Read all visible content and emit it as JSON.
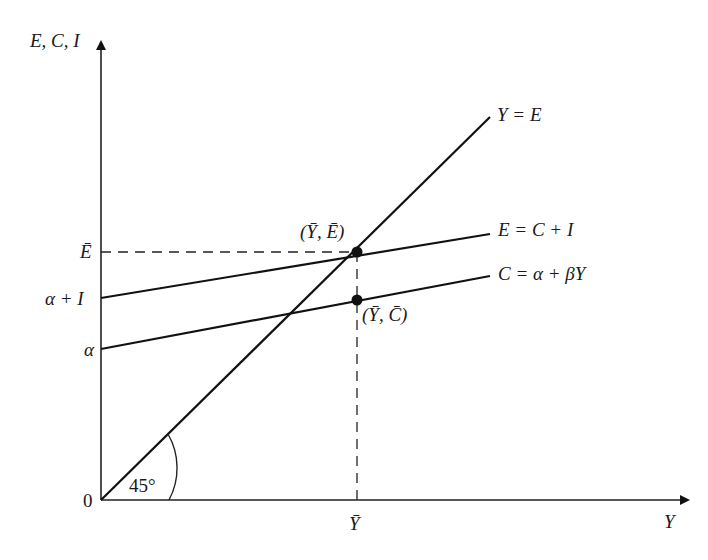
{
  "diagram": {
    "axes": {
      "y_label": "E, C, I",
      "x_label": "Y",
      "origin_label": "0"
    },
    "y_ticks": {
      "e_bar": "Ē",
      "alpha_plus_i": "α + I",
      "alpha": "α"
    },
    "x_ticks": {
      "y_bar": "Ȳ"
    },
    "lines": {
      "forty_five": "Y = E",
      "expenditure": "E = C + I",
      "consumption": "C = α + βY"
    },
    "points": {
      "equilibrium": "(Ȳ, Ē)",
      "consumption_at_eq": "(Ȳ, C̄)"
    },
    "angle_label": "45°",
    "colors": {
      "ink": "#111111",
      "background": "#ffffff"
    }
  }
}
